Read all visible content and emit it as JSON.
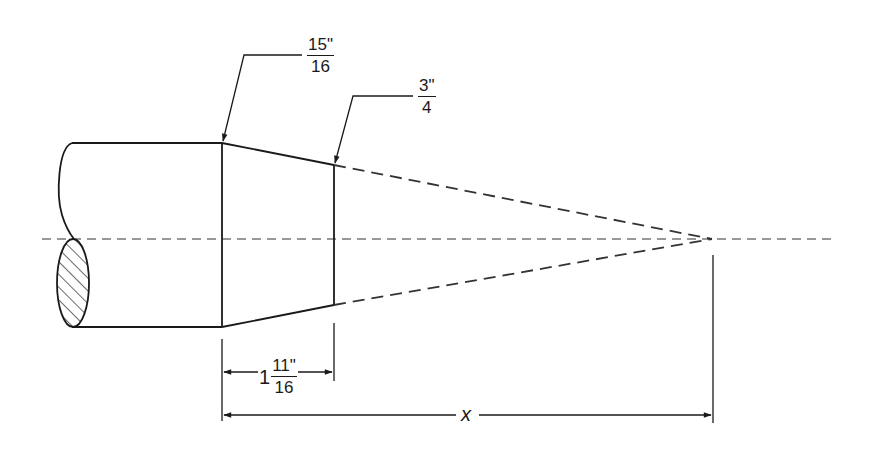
{
  "diagram": {
    "type": "technical-drawing",
    "colors": {
      "line": "#1a1a1a",
      "background": "#ffffff"
    },
    "labels": {
      "large_diameter": {
        "numerator": "15\"",
        "denominator": "16"
      },
      "small_diameter": {
        "numerator": "3\"",
        "denominator": "4"
      },
      "taper_length": {
        "whole": "1",
        "numerator": "11\"",
        "denominator": "16"
      },
      "apex_distance": {
        "variable": "x"
      }
    }
  }
}
